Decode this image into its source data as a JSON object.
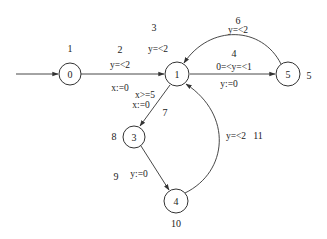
{
  "diagram": {
    "type": "timed-automaton",
    "states": [
      {
        "id": "0",
        "label": "0",
        "cx": 70,
        "cy": 74,
        "r": 11,
        "annotation": "1"
      },
      {
        "id": "1",
        "label": "1",
        "cx": 177,
        "cy": 74,
        "r": 12,
        "annotation": "3"
      },
      {
        "id": "5",
        "label": "5",
        "cx": 288,
        "cy": 74,
        "r": 12,
        "annotation": "5"
      },
      {
        "id": "3",
        "label": "3",
        "cx": 134,
        "cy": 137,
        "r": 11,
        "annotation": "8"
      },
      {
        "id": "4",
        "label": "4",
        "cx": 176,
        "cy": 201,
        "r": 12,
        "annotation": "10"
      }
    ],
    "initial_arrow": {
      "from_x": 16,
      "to_state": "0"
    },
    "transitions": [
      {
        "from": "0",
        "to": "1",
        "number": "2",
        "guard": "y=<2",
        "reset": "x:=0"
      },
      {
        "from": "1",
        "to": "5",
        "number": "4",
        "guard": "0=<y=<1",
        "reset": "y:=0"
      },
      {
        "from": "5",
        "to": "1",
        "number": "6",
        "guard": "y=<2",
        "reset": ""
      },
      {
        "from": "1",
        "to": "3",
        "number": "7",
        "guard": "x>=5",
        "reset": "x:=0"
      },
      {
        "from": "3",
        "to": "4",
        "number": "9",
        "guard": "",
        "reset": "y:=0"
      },
      {
        "from": "4",
        "to": "1",
        "number": "11",
        "guard": "y=<2",
        "reset": ""
      }
    ],
    "invariants": [
      {
        "state": "1",
        "text": "y=<2"
      }
    ]
  }
}
